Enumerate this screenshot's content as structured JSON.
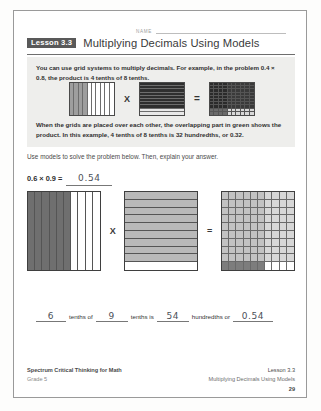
{
  "sheet": {
    "name_label": "NAME",
    "lesson_badge": "Lesson 3.3",
    "title": "Multiplying Decimals Using Models"
  },
  "info": {
    "paragraph1": "You can use grid systems to multiply decimals. For example, in the problem 0.4 × 0.8, the product is 4 tenths of 8 tenths.",
    "paragraph2": "When the grids are placed over each other, the overlapping part in green shows the product. In this example, 4 tenths of 8 tenths is 32 hundredths, or 0.32.",
    "times_symbol": "X",
    "equals_symbol": "=",
    "example": {
      "factor1": 0.4,
      "factor2": 0.8,
      "product": 0.32,
      "shaded_columns": 4,
      "shaded_rows": 8
    }
  },
  "problem": {
    "instruction": "Use models to solve the problem below. Then, explain your answer.",
    "expression": "0.6 × 0.9 =",
    "answer": "0.54",
    "times_symbol": "X",
    "equals_symbol": "=",
    "model": {
      "factor1": 0.6,
      "factor2": 0.9,
      "product": 0.54,
      "shaded_columns": 6,
      "shaded_rows": 9,
      "overlap_cells": 54
    }
  },
  "sentence": {
    "value1": "6",
    "text1": "tenths of",
    "value2": "9",
    "text2": "tenths is",
    "value3": "54",
    "text3": "hundredths  or",
    "value4": "0.54"
  },
  "footer": {
    "left_line1": "Spectrum Critical Thinking for Math",
    "left_line2": "Grade 5",
    "right_line1": "Lesson 3.3",
    "right_line2": "Multiplying Decimals Using Models",
    "page_number": "29"
  },
  "colors": {
    "badge_bg": "#595959",
    "info_bg": "#eeeeec",
    "shade_dark": "#6f6f6f",
    "shade_light": "#b9b9b9",
    "overlap": "#8a8a8a"
  }
}
